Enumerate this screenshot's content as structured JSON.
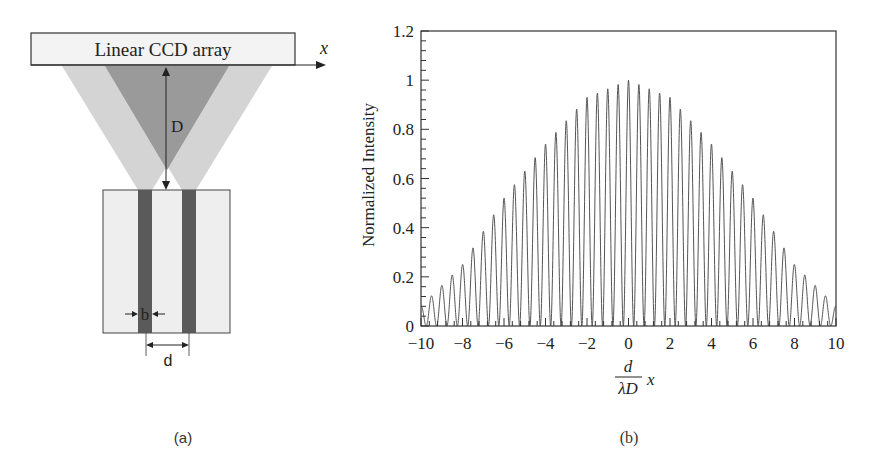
{
  "figure": {
    "panel_a": {
      "caption": "(a)",
      "ccd_label": "Linear CCD array",
      "axis_label": "x",
      "distance_label": "D",
      "slit_width_label": "b",
      "slit_separation_label": "d",
      "colors": {
        "light_cone": "#d4d4d4",
        "overlap": "#9a9a9a",
        "plate": "#eeeeee",
        "slit": "#5a5a5a",
        "outline": "#333333"
      }
    },
    "panel_b": {
      "caption": "(b)",
      "ylabel": "Normalized Intensity",
      "xlabel_num": "d",
      "xlabel_den": "λD",
      "xlabel_var": "x"
    }
  },
  "chart_data": {
    "type": "line",
    "title": "",
    "xlabel": "(d / λD) x",
    "ylabel": "Normalized Intensity",
    "xlim": [
      -10,
      10
    ],
    "ylim": [
      0,
      1.2
    ],
    "xticks": [
      -10,
      -8,
      -6,
      -4,
      -2,
      0,
      2,
      4,
      6,
      8,
      10
    ],
    "xtick_labels": [
      "−10",
      "−8",
      "−6",
      "−4",
      "−2",
      "0",
      "2",
      "4",
      "6",
      "8",
      "10"
    ],
    "yticks": [
      0,
      0.2,
      0.4,
      0.6,
      0.8,
      1,
      1.2
    ],
    "ytick_labels": [
      "0",
      "0.2",
      "0.4",
      "0.6",
      "0.8",
      "1",
      "1.2"
    ],
    "grid": false,
    "legend": null,
    "series": [
      {
        "name": "two-slit interference",
        "description": "Interference fringes (period ≈ 0.5) under a single-slit diffraction envelope",
        "fringe_period": 0.5,
        "envelope": {
          "x": [
            -10,
            -8,
            -6,
            -5,
            -4,
            -2,
            0,
            2,
            4,
            5,
            6,
            8,
            10
          ],
          "y": [
            0.08,
            0.25,
            0.52,
            0.63,
            0.74,
            0.93,
            1.0,
            0.93,
            0.74,
            0.63,
            0.52,
            0.25,
            0.08
          ]
        }
      }
    ],
    "color": "#555555"
  }
}
